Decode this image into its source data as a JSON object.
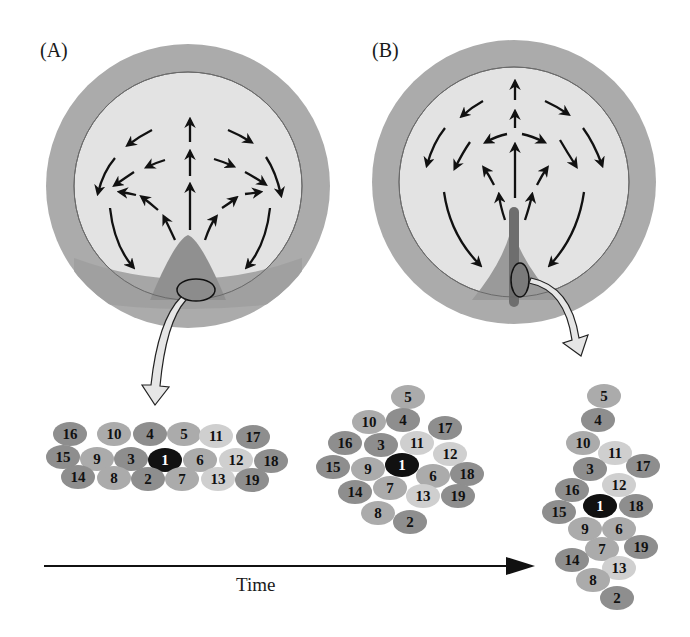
{
  "panels": {
    "A": {
      "label": "(A)"
    },
    "B": {
      "label": "(B)"
    }
  },
  "timeline": {
    "label": "Time"
  },
  "colors": {
    "outer_ring": "#a9a9a9",
    "inner_disc": "#e3e3e3",
    "marginal_zone": "#9c9c9c",
    "streak": "#707070",
    "cell_dark": "#8e8e8e",
    "cell_mid": "#ababab",
    "cell_light": "#cfcfcf",
    "cell_center": "#111111",
    "arrow": "#111111",
    "callout_fill": "#e6e6e6"
  },
  "cell_groups": [
    {
      "id": "A",
      "cells": [
        {
          "n": "16",
          "x": 70,
          "y": 434,
          "t": "dark"
        },
        {
          "n": "10",
          "x": 114,
          "y": 434,
          "t": "mid"
        },
        {
          "n": "4",
          "x": 150,
          "y": 434,
          "t": "dark"
        },
        {
          "n": "5",
          "x": 184,
          "y": 434,
          "t": "mid"
        },
        {
          "n": "11",
          "x": 216,
          "y": 436,
          "t": "light"
        },
        {
          "n": "17",
          "x": 253,
          "y": 437,
          "t": "dark"
        },
        {
          "n": "15",
          "x": 63,
          "y": 457,
          "t": "dark"
        },
        {
          "n": "9",
          "x": 97,
          "y": 459,
          "t": "mid"
        },
        {
          "n": "3",
          "x": 131,
          "y": 459,
          "t": "dark"
        },
        {
          "n": "1",
          "x": 165,
          "y": 460,
          "t": "center"
        },
        {
          "n": "6",
          "x": 200,
          "y": 460,
          "t": "mid"
        },
        {
          "n": "12",
          "x": 236,
          "y": 460,
          "t": "light"
        },
        {
          "n": "18",
          "x": 271,
          "y": 461,
          "t": "dark"
        },
        {
          "n": "14",
          "x": 78,
          "y": 477,
          "t": "dark"
        },
        {
          "n": "8",
          "x": 114,
          "y": 478,
          "t": "mid"
        },
        {
          "n": "2",
          "x": 148,
          "y": 479,
          "t": "dark"
        },
        {
          "n": "7",
          "x": 182,
          "y": 479,
          "t": "mid"
        },
        {
          "n": "13",
          "x": 218,
          "y": 479,
          "t": "light"
        },
        {
          "n": "19",
          "x": 252,
          "y": 480,
          "t": "dark"
        }
      ]
    },
    {
      "id": "B",
      "cells": [
        {
          "n": "5",
          "x": 408,
          "y": 397,
          "t": "mid"
        },
        {
          "n": "10",
          "x": 369,
          "y": 422,
          "t": "mid"
        },
        {
          "n": "4",
          "x": 403,
          "y": 420,
          "t": "dark"
        },
        {
          "n": "17",
          "x": 445,
          "y": 428,
          "t": "dark"
        },
        {
          "n": "16",
          "x": 345,
          "y": 443,
          "t": "dark"
        },
        {
          "n": "3",
          "x": 381,
          "y": 445,
          "t": "dark"
        },
        {
          "n": "11",
          "x": 417,
          "y": 443,
          "t": "light"
        },
        {
          "n": "12",
          "x": 450,
          "y": 454,
          "t": "light"
        },
        {
          "n": "15",
          "x": 333,
          "y": 467,
          "t": "dark"
        },
        {
          "n": "9",
          "x": 368,
          "y": 469,
          "t": "mid"
        },
        {
          "n": "1",
          "x": 402,
          "y": 465,
          "t": "center"
        },
        {
          "n": "6",
          "x": 433,
          "y": 476,
          "t": "mid"
        },
        {
          "n": "18",
          "x": 467,
          "y": 474,
          "t": "dark"
        },
        {
          "n": "14",
          "x": 355,
          "y": 492,
          "t": "dark"
        },
        {
          "n": "7",
          "x": 390,
          "y": 488,
          "t": "mid"
        },
        {
          "n": "13",
          "x": 423,
          "y": 496,
          "t": "light"
        },
        {
          "n": "19",
          "x": 458,
          "y": 496,
          "t": "dark"
        },
        {
          "n": "8",
          "x": 378,
          "y": 513,
          "t": "mid"
        },
        {
          "n": "2",
          "x": 410,
          "y": 522,
          "t": "dark"
        }
      ]
    },
    {
      "id": "C",
      "cells": [
        {
          "n": "5",
          "x": 604,
          "y": 396,
          "t": "mid"
        },
        {
          "n": "4",
          "x": 598,
          "y": 420,
          "t": "dark"
        },
        {
          "n": "10",
          "x": 583,
          "y": 443,
          "t": "mid"
        },
        {
          "n": "11",
          "x": 615,
          "y": 453,
          "t": "light"
        },
        {
          "n": "3",
          "x": 590,
          "y": 469,
          "t": "dark"
        },
        {
          "n": "17",
          "x": 643,
          "y": 466,
          "t": "dark"
        },
        {
          "n": "12",
          "x": 619,
          "y": 485,
          "t": "light"
        },
        {
          "n": "16",
          "x": 572,
          "y": 490,
          "t": "dark"
        },
        {
          "n": "1",
          "x": 600,
          "y": 506,
          "t": "center"
        },
        {
          "n": "18",
          "x": 636,
          "y": 506,
          "t": "dark"
        },
        {
          "n": "15",
          "x": 559,
          "y": 512,
          "t": "dark"
        },
        {
          "n": "9",
          "x": 585,
          "y": 529,
          "t": "mid"
        },
        {
          "n": "6",
          "x": 619,
          "y": 529,
          "t": "mid"
        },
        {
          "n": "7",
          "x": 602,
          "y": 549,
          "t": "mid"
        },
        {
          "n": "19",
          "x": 641,
          "y": 547,
          "t": "dark"
        },
        {
          "n": "14",
          "x": 572,
          "y": 560,
          "t": "dark"
        },
        {
          "n": "13",
          "x": 619,
          "y": 568,
          "t": "light"
        },
        {
          "n": "8",
          "x": 593,
          "y": 580,
          "t": "mid"
        },
        {
          "n": "2",
          "x": 617,
          "y": 598,
          "t": "dark"
        }
      ]
    }
  ]
}
